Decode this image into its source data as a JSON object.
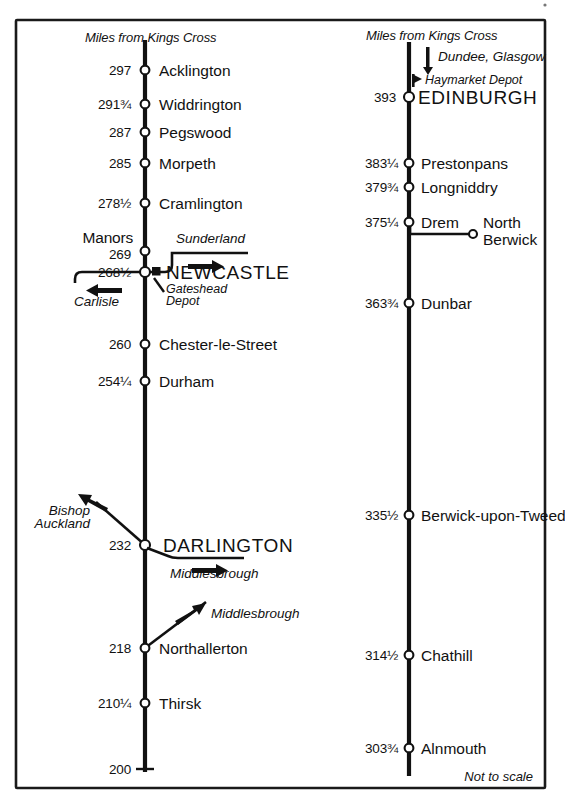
{
  "diagram": {
    "footnote": "Not to scale",
    "column_header": "Miles from Kings Cross",
    "ink_color": "#111111",
    "background_color": "#ffffff"
  },
  "left_column": {
    "header": "Miles from Kings Cross",
    "stations": [
      {
        "mileage": "297",
        "name": "Acklington",
        "marker": "circle"
      },
      {
        "mileage": "291¾",
        "name": "Widdrington",
        "marker": "circle"
      },
      {
        "mileage": "287",
        "name": "Pegswood",
        "marker": "circle"
      },
      {
        "mileage": "285",
        "name": "Morpeth",
        "marker": "circle"
      },
      {
        "mileage": "278½",
        "name": "Cramlington",
        "marker": "circle"
      },
      {
        "mileage": "269",
        "name": "Manors",
        "marker": "circle"
      },
      {
        "mileage": "268½",
        "name": "NEWCASTLE",
        "marker": "circle"
      },
      {
        "mileage": "260",
        "name": "Chester-le-Street",
        "marker": "circle"
      },
      {
        "mileage": "254¼",
        "name": "Durham",
        "marker": "circle"
      },
      {
        "mileage": "232",
        "name": "DARLINGTON",
        "marker": "circle"
      },
      {
        "mileage": "218",
        "name": "Northallerton",
        "marker": "circle"
      },
      {
        "mileage": "210¼",
        "name": "Thirsk",
        "marker": "circle"
      },
      {
        "mileage": "200",
        "name": "",
        "marker": "tick"
      }
    ],
    "branches": [
      {
        "label": "Sunderland",
        "direction": "right",
        "from": "Newcastle"
      },
      {
        "label": "Carlisle",
        "direction": "left",
        "from": "Newcastle"
      },
      {
        "label": "Bishop Auckland",
        "direction": "upper-left",
        "from": "Darlington"
      },
      {
        "label": "Middlesbrough",
        "direction": "right",
        "from": "Darlington"
      },
      {
        "label": "Middlesbrough",
        "direction": "upper-right",
        "from": "Northallerton"
      }
    ],
    "depots": [
      {
        "label": "Gateshead Depot",
        "near": "NEWCASTLE",
        "marker": "filled-square"
      }
    ]
  },
  "right_column": {
    "header": "Miles from Kings Cross",
    "stations": [
      {
        "mileage": "393",
        "name": "EDINBURGH",
        "marker": "circle"
      },
      {
        "mileage": "383¼",
        "name": "Prestonpans",
        "marker": "circle"
      },
      {
        "mileage": "379¾",
        "name": "Longniddry",
        "marker": "circle"
      },
      {
        "mileage": "375¼",
        "name": "Drem",
        "marker": "circle"
      },
      {
        "mileage": "363¾",
        "name": "Dunbar",
        "marker": "circle"
      },
      {
        "mileage": "335½",
        "name": "Berwick-upon-Tweed",
        "marker": "circle"
      },
      {
        "mileage": "314½",
        "name": "Chathill",
        "marker": "circle"
      },
      {
        "mileage": "303¾",
        "name": "Alnmouth",
        "marker": "circle"
      }
    ],
    "branches": [
      {
        "label": "Dundee, Glasgow",
        "direction": "up",
        "from": "Edinburgh"
      },
      {
        "label": "North Berwick",
        "direction": "right",
        "from": "Drem",
        "marker": "circle"
      }
    ],
    "depots": [
      {
        "label": "Haymarket Depot",
        "near": "EDINBURGH",
        "marker": "filled-flag"
      }
    ]
  },
  "labels": {
    "left_header": "Miles from Kings Cross",
    "right_header": "Miles from Kings Cross",
    "m297": "297",
    "s297": "Acklington",
    "m291": "291¾",
    "s291": "Widdrington",
    "m287": "287",
    "s287": "Pegswood",
    "m285": "285",
    "s285": "Morpeth",
    "m278": "278½",
    "s278": "Cramlington",
    "manors": "Manors",
    "m269": "269",
    "m268": "268½",
    "s268": "NEWCASTLE",
    "sunderland": "Sunderland",
    "carlisle": "Carlisle",
    "gateshead": "Gateshead",
    "depot": "Depot",
    "m260": "260",
    "s260": "Chester-le-Street",
    "m254": "254¼",
    "s254": "Durham",
    "bishop": "Bishop",
    "auckland": "Auckland",
    "m232": "232",
    "s232": "DARLINGTON",
    "middlesbrough1": "Middlesbrough",
    "middlesbrough2": "Middlesbrough",
    "m218": "218",
    "s218": "Northallerton",
    "m210": "210¼",
    "s210": "Thirsk",
    "m200": "200",
    "dundee": "Dundee, Glasgow",
    "haymarket": "Haymarket Depot",
    "m393": "393",
    "s393": "EDINBURGH",
    "m383": "383¼",
    "s383": "Prestonpans",
    "m379": "379¾",
    "s379": "Longniddry",
    "m375": "375¼",
    "s375": "Drem",
    "north": "North",
    "berwick": "Berwick",
    "m363": "363¾",
    "s363": "Dunbar",
    "m335": "335½",
    "s335": "Berwick-upon-Tweed",
    "m314": "314½",
    "s314": "Chathill",
    "m303": "303¾",
    "s303": "Alnmouth",
    "notToScale": "Not to scale"
  }
}
